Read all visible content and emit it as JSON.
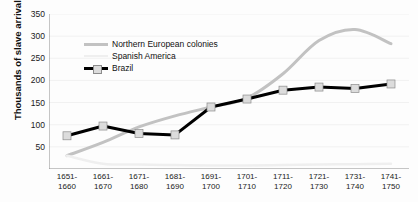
{
  "chart_data": {
    "type": "line",
    "title": "",
    "xlabel": "",
    "ylabel": "Thousands of slave arrivals",
    "ylim": [
      0,
      350
    ],
    "yticks": [
      50,
      100,
      150,
      200,
      250,
      300,
      350
    ],
    "grid": true,
    "legend_position": "upper-left-inside",
    "categories": [
      "1651-1660",
      "1661-1670",
      "1671-1680",
      "1681-1690",
      "1691-1700",
      "1701-1710",
      "1711-1720",
      "1721-1730",
      "1731-1740",
      "1741-1750"
    ],
    "category_lines": [
      [
        "1651-",
        "1660"
      ],
      [
        "1661-",
        "1670"
      ],
      [
        "1671-",
        "1680"
      ],
      [
        "1681-",
        "1690"
      ],
      [
        "1691-",
        "1700"
      ],
      [
        "1701-",
        "1710"
      ],
      [
        "1711-",
        "1720"
      ],
      [
        "1721-",
        "1730"
      ],
      [
        "1731-",
        "1740"
      ],
      [
        "1741-",
        "1750"
      ]
    ],
    "series": [
      {
        "name": "Northern European colonies",
        "color": "#c2c2c2",
        "marker": "none",
        "width": 3,
        "values": [
          30,
          60,
          95,
          120,
          140,
          160,
          215,
          290,
          315,
          283
        ]
      },
      {
        "name": "Spanish America",
        "color": "#efefef",
        "marker": "none",
        "width": 2.5,
        "values": [
          30,
          12,
          10,
          9,
          8,
          8,
          9,
          10,
          11,
          12
        ]
      },
      {
        "name": "Brazil",
        "color": "#000000",
        "marker": "square",
        "marker_color": "#dcdcdc",
        "marker_edge": "#8c8c8c",
        "width": 3,
        "values": [
          75,
          97,
          80,
          77,
          140,
          158,
          178,
          185,
          182,
          192
        ]
      }
    ]
  },
  "axes": {
    "axis_color": "#8d8d8d",
    "grid_color": "#f1f1f1",
    "tick_color": "#8d8d8d"
  }
}
